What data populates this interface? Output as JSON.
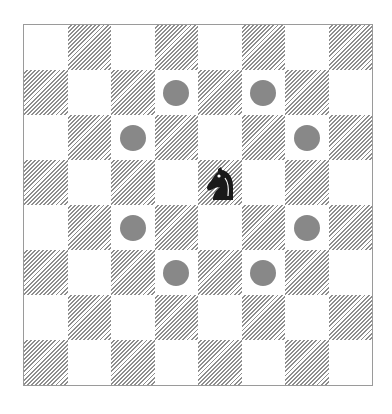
{
  "diagram": {
    "title": "",
    "board": {
      "rows": 8,
      "cols": 8,
      "top_left_shade": "light"
    },
    "piece": {
      "type": "knight",
      "color": "black",
      "row": 3,
      "col": 4,
      "icon": "knight-icon"
    },
    "move_targets": [
      {
        "row": 1,
        "col": 3
      },
      {
        "row": 1,
        "col": 5
      },
      {
        "row": 2,
        "col": 2
      },
      {
        "row": 2,
        "col": 6
      },
      {
        "row": 4,
        "col": 2
      },
      {
        "row": 4,
        "col": 6
      },
      {
        "row": 5,
        "col": 3
      },
      {
        "row": 5,
        "col": 5
      }
    ],
    "colors": {
      "dot": "#888888",
      "hatch": "#8e8e8e",
      "light": "#ffffff",
      "piece": "#1a1a1a"
    }
  }
}
